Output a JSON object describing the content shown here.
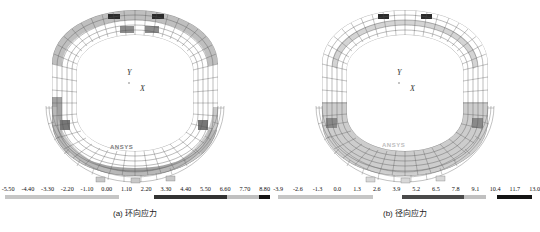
{
  "figure": {
    "background": "#ffffff",
    "panels": [
      {
        "id": "a",
        "caption": "(a) 环向应力",
        "axis_y_label": "Y",
        "axis_x_label": "X",
        "watermark": "ANSYS",
        "legend": {
          "ticks": [
            "-5.50",
            "-4.40",
            "-3.30",
            "-2.20",
            "-1.10",
            "0.00",
            "1.10",
            "2.20",
            "3.30",
            "4.40",
            "5.50",
            "6.60",
            "7.70",
            "8.80"
          ],
          "segments": [
            {
              "start_pct": 2.0,
              "end_pct": 44.0,
              "color": "#c6c6c6"
            },
            {
              "start_pct": 57.0,
              "end_pct": 84.0,
              "color": "#333333"
            },
            {
              "start_pct": 84.0,
              "end_pct": 96.0,
              "color": "#c0c0c0"
            },
            {
              "start_pct": 96.0,
              "end_pct": 100.0,
              "color": "#141414"
            }
          ]
        }
      },
      {
        "id": "b",
        "caption": "(b) 径向应力",
        "axis_y_label": "Y",
        "axis_x_label": "X",
        "watermark": "ANSYS",
        "legend": {
          "ticks": [
            "-3.9",
            "-2.6",
            "-1.3",
            "0.0",
            "1.3",
            "2.6",
            "3.9",
            "5.2",
            "6.5",
            "7.8",
            "9.1",
            "10.4",
            "11.7",
            "13.0"
          ],
          "segments": [
            {
              "start_pct": 3.0,
              "end_pct": 38.0,
              "color": "#c6c6c6"
            },
            {
              "start_pct": 49.0,
              "end_pct": 72.0,
              "color": "#4a4a4a"
            },
            {
              "start_pct": 72.0,
              "end_pct": 80.0,
              "color": "#c0c0c0"
            },
            {
              "start_pct": 84.0,
              "end_pct": 97.0,
              "color": "#141414"
            }
          ]
        }
      }
    ]
  },
  "chart_data": {
    "type": "heatmap",
    "title": "",
    "charts": [
      {
        "name": "(a) 环向应力",
        "quantity": "Circumferential stress",
        "colorbar_ticks": [
          -5.5,
          -4.4,
          -3.3,
          -2.2,
          -1.1,
          0.0,
          1.1,
          2.2,
          3.3,
          4.4,
          5.5,
          6.6,
          7.7,
          8.8
        ],
        "colorbar_range": [
          -5.5,
          8.8
        ],
        "colormap": "grayscale",
        "axis_labels": {
          "x": "X",
          "y": "Y"
        }
      },
      {
        "name": "(b) 径向应力",
        "quantity": "Radial stress",
        "colorbar_ticks": [
          -3.9,
          -2.6,
          -1.3,
          0.0,
          1.3,
          2.6,
          3.9,
          5.2,
          6.5,
          7.8,
          9.1,
          10.4,
          11.7,
          13.0
        ],
        "colorbar_range": [
          -3.9,
          13.0
        ],
        "colormap": "grayscale",
        "axis_labels": {
          "x": "X",
          "y": "Y"
        }
      }
    ],
    "grid": false,
    "legend_position": "bottom"
  }
}
